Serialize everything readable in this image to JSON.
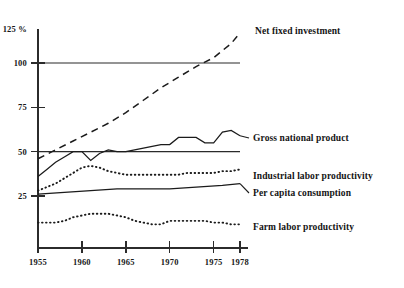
{
  "chart_data": {
    "type": "line",
    "title": "",
    "subtitle": "",
    "xlabel": "",
    "ylabel": "",
    "unit": "%",
    "xlim": [
      1955,
      1978
    ],
    "ylim": [
      0,
      125
    ],
    "grid": false,
    "legend_position": "right-inline-labels",
    "yticks": [
      {
        "value": 125,
        "label": "125 %"
      },
      {
        "value": 100,
        "label": "100"
      },
      {
        "value": 75,
        "label": "75"
      },
      {
        "value": 50,
        "label": "50"
      },
      {
        "value": 25,
        "label": "25"
      }
    ],
    "xticks": [
      {
        "value": 1955,
        "label": "1955"
      },
      {
        "value": 1960,
        "label": "1960"
      },
      {
        "value": 1965,
        "label": "1965"
      },
      {
        "value": 1970,
        "label": "1970"
      },
      {
        "value": 1975,
        "label": "1975"
      },
      {
        "value": 1978,
        "label": "1978"
      }
    ],
    "reference_lines": [
      {
        "value": 100,
        "style": "solid",
        "x_start": 1955,
        "x_end": 1978
      },
      {
        "value": 50,
        "style": "solid",
        "x_start": 1955,
        "x_end": 1978
      }
    ],
    "series": [
      {
        "name": "Net fixed investment",
        "style": "dashed",
        "label": "Net fixed investment",
        "x": [
          1955,
          1957,
          1959,
          1961,
          1963,
          1965,
          1967,
          1969,
          1971,
          1973,
          1975,
          1977,
          1978
        ],
        "values": [
          46,
          51,
          56,
          61,
          66,
          72,
          79,
          86,
          92,
          98,
          103,
          111,
          117
        ]
      },
      {
        "name": "Gross national product",
        "style": "solid",
        "label": "Gross national product",
        "x": [
          1955,
          1956,
          1957,
          1958,
          1959,
          1960,
          1961,
          1962,
          1963,
          1964,
          1965,
          1966,
          1967,
          1968,
          1969,
          1970,
          1971,
          1972,
          1973,
          1974,
          1975,
          1976,
          1977,
          1978
        ],
        "values": [
          36,
          40,
          44,
          47,
          50,
          50,
          45,
          49,
          51,
          50,
          50,
          51,
          52,
          53,
          54,
          54,
          58,
          58,
          58,
          55,
          55,
          61,
          62,
          59
        ]
      },
      {
        "name": "Industrial labor productivity",
        "style": "dotted",
        "label": "Industrial labor productivity",
        "x": [
          1955,
          1956,
          1957,
          1958,
          1959,
          1960,
          1961,
          1962,
          1963,
          1964,
          1965,
          1966,
          1967,
          1968,
          1969,
          1970,
          1971,
          1972,
          1973,
          1974,
          1975,
          1976,
          1977,
          1978
        ],
        "values": [
          28,
          30,
          32,
          35,
          38,
          41,
          42,
          41,
          39,
          38,
          37,
          37,
          37,
          37,
          37,
          37,
          37,
          38,
          38,
          38,
          38,
          39,
          39,
          40
        ]
      },
      {
        "name": "Per capita consumption",
        "style": "solid",
        "label": "Per capita consumption",
        "x": [
          1955,
          1958,
          1961,
          1964,
          1967,
          1970,
          1973,
          1976,
          1978
        ],
        "values": [
          26,
          27,
          28,
          29,
          29,
          29,
          30,
          31,
          32
        ]
      },
      {
        "name": "Farm labor productivity",
        "style": "dotted",
        "label": "Farm labor productivity",
        "x": [
          1955,
          1956,
          1957,
          1958,
          1959,
          1960,
          1961,
          1962,
          1963,
          1964,
          1965,
          1966,
          1967,
          1968,
          1969,
          1970,
          1971,
          1972,
          1973,
          1974,
          1975,
          1976,
          1977,
          1978
        ],
        "values": [
          10,
          10,
          10,
          11,
          13,
          14,
          15,
          15,
          15,
          14,
          13,
          11,
          10,
          9,
          9,
          11,
          11,
          11,
          11,
          11,
          10,
          10,
          9,
          9
        ]
      }
    ]
  },
  "colors": {
    "ink": "#1b1b1b",
    "axis": "#2b2b2b",
    "background": "#ffffff"
  }
}
